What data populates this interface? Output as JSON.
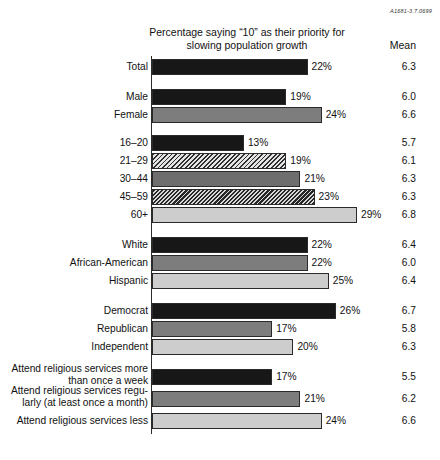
{
  "corner_code": "A1681-3.7.0699",
  "header": {
    "title": "Percentage saying “10” as their priority for slowing population growth",
    "mean_column_label": "Mean"
  },
  "chart_data": {
    "type": "bar",
    "orientation": "horizontal",
    "title": "Percentage saying “10” as their priority for slowing population growth",
    "xlabel": "",
    "ylabel": "",
    "xlim": [
      0,
      29
    ],
    "grid": false,
    "legend": false,
    "value_suffix": "%",
    "extra_column": {
      "label": "Mean",
      "values": [
        6.3,
        6.0,
        6.6,
        5.7,
        6.1,
        6.3,
        6.3,
        6.8,
        6.4,
        6.0,
        6.4,
        6.7,
        5.8,
        6.3,
        5.5,
        6.2,
        6.6
      ]
    },
    "categories": [
      "Total",
      "Male",
      "Female",
      "16–20",
      "21–29",
      "30–44",
      "45–59",
      "60+",
      "White",
      "African-American",
      "Hispanic",
      "Democrat",
      "Republican",
      "Independent",
      "Attend religious services more than once a week",
      "Attend religious services regularly (at least once a month)",
      "Attend religious services less"
    ],
    "values": [
      22,
      19,
      24,
      13,
      19,
      21,
      23,
      29,
      22,
      22,
      25,
      26,
      17,
      20,
      17,
      21,
      24
    ]
  },
  "rows": [
    {
      "label": "Total",
      "value_text": "22%",
      "mean_text": "6.3",
      "fill": "fill-black",
      "multiline": false
    },
    {
      "label": "Male",
      "value_text": "19%",
      "mean_text": "6.0",
      "fill": "fill-black",
      "multiline": false
    },
    {
      "label": "Female",
      "value_text": "24%",
      "mean_text": "6.6",
      "fill": "fill-mid",
      "multiline": false
    },
    {
      "label": "16–20",
      "value_text": "13%",
      "mean_text": "5.7",
      "fill": "fill-black",
      "multiline": false
    },
    {
      "label": "21–29",
      "value_text": "19%",
      "mean_text": "6.1",
      "fill": "fill-hatch-a",
      "multiline": false
    },
    {
      "label": "30–44",
      "value_text": "21%",
      "mean_text": "6.3",
      "fill": "fill-dark",
      "multiline": false
    },
    {
      "label": "45–59",
      "value_text": "23%",
      "mean_text": "6.3",
      "fill": "fill-hatch-b",
      "multiline": false
    },
    {
      "label": "60+",
      "value_text": "29%",
      "mean_text": "6.8",
      "fill": "fill-light",
      "multiline": false
    },
    {
      "label": "White",
      "value_text": "22%",
      "mean_text": "6.4",
      "fill": "fill-black",
      "multiline": false
    },
    {
      "label": "African-American",
      "value_text": "22%",
      "mean_text": "6.0",
      "fill": "fill-mid",
      "multiline": false
    },
    {
      "label": "Hispanic",
      "value_text": "25%",
      "mean_text": "6.4",
      "fill": "fill-light",
      "multiline": false
    },
    {
      "label": "Democrat",
      "value_text": "26%",
      "mean_text": "6.7",
      "fill": "fill-black",
      "multiline": false
    },
    {
      "label": "Republican",
      "value_text": "17%",
      "mean_text": "5.8",
      "fill": "fill-mid",
      "multiline": false
    },
    {
      "label": "Independent",
      "value_text": "20%",
      "mean_text": "6.3",
      "fill": "fill-light",
      "multiline": false
    },
    {
      "label": "Attend religious services more\nthan once a week",
      "value_text": "17%",
      "mean_text": "5.5",
      "fill": "fill-black",
      "multiline": true
    },
    {
      "label": "Attend religious services regu-\nlarly (at least once a month)",
      "value_text": "21%",
      "mean_text": "6.2",
      "fill": "fill-mid",
      "multiline": true
    },
    {
      "label": "Attend religious services less",
      "value_text": "24%",
      "mean_text": "6.6",
      "fill": "fill-light",
      "multiline": false
    }
  ],
  "layout": {
    "bar_origin_x": 152,
    "px_per_percent": 7.07,
    "row_tops": [
      58,
      88,
      106,
      134,
      152,
      170,
      188,
      206,
      236,
      254,
      272,
      302,
      320,
      338,
      368,
      390,
      412
    ]
  }
}
